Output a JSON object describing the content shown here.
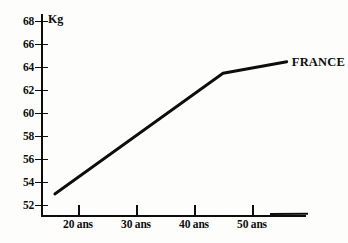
{
  "chart_data": {
    "type": "line",
    "title": "",
    "subtitle": "",
    "xlabel": "",
    "ylabel": "Kg",
    "unit_label": "Kg",
    "xlim": [
      15,
      56
    ],
    "ylim": [
      50.6,
      68.9
    ],
    "grid": false,
    "legend_position": "right-inline",
    "x_tick_labels": [
      "20 ans",
      "30 ans",
      "40 ans",
      "50 ans"
    ],
    "x_tick_values": [
      20,
      30,
      40,
      50
    ],
    "y_tick_labels": [
      "52",
      "54",
      "56",
      "58",
      "60",
      "62",
      "64",
      "66",
      "68"
    ],
    "y_tick_values": [
      52,
      54,
      56,
      58,
      60,
      62,
      64,
      66,
      68
    ],
    "series": [
      {
        "name": "FRANCE",
        "color": "#0d0d0d",
        "x": [
          16,
          45,
          56
        ],
        "y": [
          53.0,
          63.5,
          64.5
        ],
        "points": [
          {
            "x": 16,
            "y": 53.0
          },
          {
            "x": 45,
            "y": 63.5
          },
          {
            "x": 56,
            "y": 64.5
          }
        ]
      }
    ],
    "annotations": [
      {
        "name": "series-label-france",
        "text": "FRANCE",
        "x": 56,
        "y": 64.5
      }
    ]
  },
  "axes": {
    "y_unit": "Kg",
    "y_ticks": [
      {
        "label": "68",
        "value": 68
      },
      {
        "label": "66",
        "value": 66
      },
      {
        "label": "64",
        "value": 64
      },
      {
        "label": "62",
        "value": 62
      },
      {
        "label": "60",
        "value": 60
      },
      {
        "label": "58",
        "value": 58
      },
      {
        "label": "56",
        "value": 56
      },
      {
        "label": "54",
        "value": 54
      },
      {
        "label": "52",
        "value": 52
      }
    ],
    "x_ticks": [
      {
        "label": "20 ans",
        "value": 20
      },
      {
        "label": "30 ans",
        "value": 30
      },
      {
        "label": "40 ans",
        "value": 40
      },
      {
        "label": "50 ans",
        "value": 50
      }
    ]
  },
  "legend": {
    "entries": [
      {
        "label": "FRANCE",
        "color": "#0d0d0d"
      }
    ]
  },
  "colors": {
    "line": "#0d0d0d",
    "axis": "#0d0d0d",
    "text": "#0d0d0d",
    "background": "#fdfdfc"
  }
}
